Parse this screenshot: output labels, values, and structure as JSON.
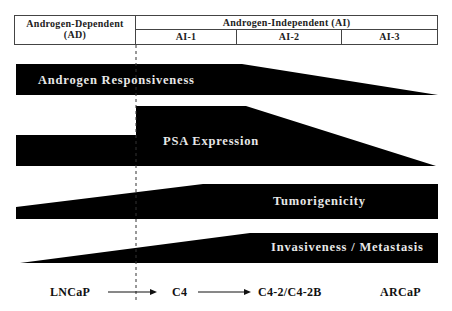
{
  "header": {
    "androgen_dependent": {
      "line1": "Androgen-Dependent",
      "line2": "(AD)"
    },
    "androgen_independent": "Androgen-Independent (AI)",
    "stages": [
      "AI-1",
      "AI-2",
      "AI-3"
    ]
  },
  "bars": [
    {
      "label": "Androgen Responsiveness",
      "trend": "high in AD and AI-1, decreasing through AI-2 to none at AI-3"
    },
    {
      "label": "PSA Expression",
      "trend": "moderate in AD, step up at AI-1, decreasing through AI-2 to none at AI-3"
    },
    {
      "label": "Tumorigenicity",
      "trend": "low in AD, increasing to plateau from mid AI-1 onward"
    },
    {
      "label": "Invasiveness / Metastasis",
      "trend": "none at start of AD, increasing to plateau from mid AI-2 onward"
    }
  ],
  "cell_lines": {
    "items": [
      "LNCaP",
      "C4",
      "C4-2/C4-2B",
      "ARCaP"
    ],
    "arrows": [
      "LNCaP to C4",
      "C4 to C4-2/C4-2B"
    ]
  },
  "colors": {
    "bar_fill": "#000000",
    "bar_text": "#e8e8e8",
    "text": "#111111",
    "border": "#444444"
  }
}
